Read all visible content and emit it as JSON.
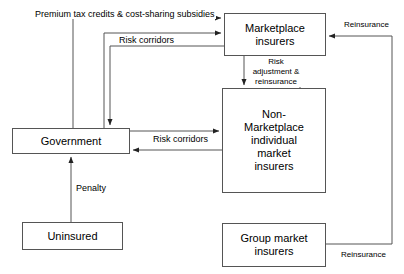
{
  "diagram": {
    "type": "flow-diagram",
    "background_color": "#ffffff",
    "line_color": "#555555",
    "text_color": "#000000",
    "nodes": [
      {
        "id": "marketplace-insurers",
        "label": "Marketplace\ninsurers",
        "x": 224,
        "y": 13,
        "w": 102,
        "h": 43
      },
      {
        "id": "non-marketplace-insurers",
        "label": "Non-\nMarketplace\nindividual\nmarket\ninsurers",
        "x": 222,
        "y": 88,
        "w": 104,
        "h": 105
      },
      {
        "id": "government",
        "label": "Government",
        "x": 12,
        "y": 128,
        "w": 118,
        "h": 26
      },
      {
        "id": "uninsured",
        "label": "Uninsured",
        "x": 22,
        "y": 222,
        "w": 101,
        "h": 28
      },
      {
        "id": "group-market-insurers",
        "label": "Group market\ninsurers",
        "x": 222,
        "y": 223,
        "w": 104,
        "h": 44
      }
    ],
    "edge_labels": [
      {
        "id": "premium-tax-credits",
        "text": "Premium tax credits & cost-sharing subsidies",
        "x": 34,
        "y": 9,
        "size": "sz9"
      },
      {
        "id": "risk-corridors-top",
        "text": "Risk corridors",
        "x": 118,
        "y": 35,
        "size": "sz9"
      },
      {
        "id": "risk-adjustment-reinsurance",
        "text": "Risk\nadjustment &\nreinsurance",
        "x": 248,
        "y": 57,
        "size": "sz8"
      },
      {
        "id": "reinsurance-top",
        "text": "Reinsurance",
        "x": 343,
        "y": 20,
        "size": "sz8"
      },
      {
        "id": "risk-corridors-middle",
        "text": "Risk corridors",
        "x": 152,
        "y": 134,
        "size": "sz9"
      },
      {
        "id": "penalty",
        "text": "Penalty",
        "x": 75,
        "y": 183,
        "size": "sz9"
      },
      {
        "id": "reinsurance-bottom",
        "text": "Reinsurance",
        "x": 340,
        "y": 250,
        "size": "sz8"
      }
    ],
    "edges": [
      {
        "id": "government-to-marketplace-subsidies",
        "from": "government",
        "to": "marketplace-insurers",
        "label": "Premium tax credits & cost-sharing subsidies",
        "direction": "to-marketplace"
      },
      {
        "id": "government-to-marketplace-risk-corridors",
        "from": "government",
        "to": "marketplace-insurers",
        "label": "Risk corridors",
        "direction": "to-marketplace"
      },
      {
        "id": "marketplace-to-government-risk-corridors",
        "from": "marketplace-insurers",
        "to": "government",
        "label": "Risk corridors",
        "direction": "to-government"
      },
      {
        "id": "marketplace-to-nonmarketplace",
        "from": "marketplace-insurers",
        "to": "non-marketplace-insurers",
        "label": "Risk adjustment & reinsurance",
        "direction": "down"
      },
      {
        "id": "nonmarketplace-to-marketplace",
        "from": "non-marketplace-insurers",
        "to": "marketplace-insurers",
        "label": "Risk adjustment & reinsurance",
        "direction": "up"
      },
      {
        "id": "government-to-nonmarketplace-risk-corridors",
        "from": "government",
        "to": "non-marketplace-insurers",
        "label": "Risk corridors",
        "direction": "right"
      },
      {
        "id": "nonmarketplace-to-government-risk-corridors",
        "from": "non-marketplace-insurers",
        "to": "government",
        "label": "Risk corridors",
        "direction": "left"
      },
      {
        "id": "uninsured-to-government-penalty",
        "from": "uninsured",
        "to": "government",
        "label": "Penalty",
        "direction": "up"
      },
      {
        "id": "group-market-to-marketplace-reinsurance",
        "from": "group-market-insurers",
        "to": "marketplace-insurers",
        "label": "Reinsurance",
        "direction": "around-right"
      }
    ]
  }
}
